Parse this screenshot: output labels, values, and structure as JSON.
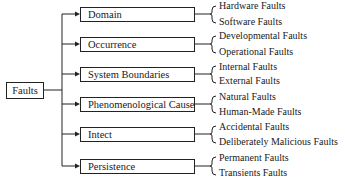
{
  "diagram": {
    "root": {
      "label": "Faults"
    },
    "categories": [
      {
        "label": "Domain",
        "children": [
          "Hardware Faults",
          "Software Faults"
        ]
      },
      {
        "label": "Occurrence",
        "children": [
          "Developmental Faults",
          "Operational Faults"
        ]
      },
      {
        "label": "System Boundaries",
        "children": [
          "Internal Faults",
          "External Faults"
        ]
      },
      {
        "label": "Phenomenological Cause",
        "children": [
          "Natural Faults",
          "Human-Made Faults"
        ]
      },
      {
        "label": "Intect",
        "children": [
          "Accidental Faults",
          "Deliberately Malicious Faults"
        ]
      },
      {
        "label": "Persistence",
        "children": [
          "Permanent Faults",
          "Transients Faults"
        ]
      }
    ]
  }
}
